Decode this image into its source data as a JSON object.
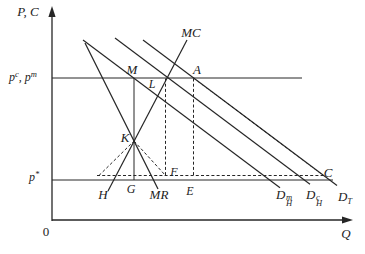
{
  "figure": {
    "width": 365,
    "height": 254,
    "background_color": "#ffffff",
    "line_color": "#262626",
    "axes": {
      "y_axis": {
        "x": 52,
        "y_top": 14,
        "y_bottom": 221,
        "label": "P, C"
      },
      "x_axis": {
        "y": 220,
        "x_left": 52,
        "x_right": 347,
        "label": "Q"
      },
      "origin_label": "0"
    },
    "price_lines": [
      {
        "id": "cartel-monopoly-price",
        "label": "p^c, p^m",
        "y": 78
      },
      {
        "id": "world-price",
        "label": "p*",
        "y": 180
      }
    ],
    "curve_labels": [
      "MC",
      "MR",
      "D_H^m",
      "D_H^c",
      "D_T"
    ],
    "point_labels": [
      "M",
      "A",
      "L",
      "K",
      "F",
      "G",
      "H",
      "E",
      "C"
    ],
    "lines": [
      {
        "name": "pc-pm-price-line",
        "x1": 52,
        "y1": 78,
        "x2": 302,
        "y2": 78,
        "dashed": false,
        "w": 1.0
      },
      {
        "name": "p-star-price-line",
        "x1": 52,
        "y1": 180,
        "x2": 333,
        "y2": 180,
        "dashed": false,
        "w": 1.0
      },
      {
        "name": "mr-curve",
        "x1": 85,
        "y1": 43,
        "x2": 158,
        "y2": 189,
        "dashed": false,
        "w": 1.2
      },
      {
        "name": "mc-curve",
        "x1": 108,
        "y1": 191,
        "x2": 187,
        "y2": 40,
        "dashed": false,
        "w": 1.2
      },
      {
        "name": "dhm-demand-curve",
        "x1": 83,
        "y1": 40,
        "x2": 280,
        "y2": 187.7,
        "dashed": false,
        "w": 1.2
      },
      {
        "name": "dhc-demand-curve",
        "x1": 115,
        "y1": 38,
        "x2": 310,
        "y2": 184.3,
        "dashed": false,
        "w": 1.2
      },
      {
        "name": "dt-demand-curve",
        "x1": 143,
        "y1": 40,
        "x2": 337,
        "y2": 185.6,
        "dashed": false,
        "w": 1.2
      },
      {
        "name": "monopoly-quantity-vertical-MG",
        "x1": 134,
        "y1": 78,
        "x2": 134,
        "y2": 180,
        "dashed": false,
        "w": 1.0
      },
      {
        "name": "dashed-horizontal-above-p-star",
        "x1": 97,
        "y1": 175.5,
        "x2": 323.5,
        "y2": 175.5,
        "dashed": true,
        "w": 1.0
      },
      {
        "name": "dashed-vertical-LF",
        "x1": 165.5,
        "y1": 78.5,
        "x2": 165.5,
        "y2": 175.5,
        "dashed": true,
        "w": 1.0
      },
      {
        "name": "dashed-vertical-AE",
        "x1": 193.5,
        "y1": 78.5,
        "x2": 193.5,
        "y2": 175.5,
        "dashed": true,
        "w": 1.0
      },
      {
        "name": "dashed-diagonal-AC",
        "x1": 193.5,
        "y1": 78,
        "x2": 323.5,
        "y2": 175.5,
        "dashed": true,
        "w": 1.0
      },
      {
        "name": "dashed-segment-HK",
        "x1": 99,
        "y1": 175.5,
        "x2": 134,
        "y2": 141,
        "dashed": true,
        "w": 1.0
      },
      {
        "name": "dashed-segment-KF",
        "x1": 134,
        "y1": 141,
        "x2": 165.5,
        "y2": 175.5,
        "dashed": true,
        "w": 1.0
      }
    ],
    "arrows": [
      {
        "name": "y-axis-arrow",
        "points": "52,6 48.4,17 55.6,17"
      },
      {
        "name": "x-axis-arrow",
        "points": "353,220 342,216.4 342,223.6"
      }
    ],
    "axis_segments": [
      {
        "name": "y-axis-line",
        "x1": 52,
        "y1": 221,
        "x2": 52,
        "y2": 14,
        "dashed": false,
        "w": 1.3
      },
      {
        "name": "x-axis-line",
        "x1": 52,
        "y1": 220,
        "x2": 347,
        "y2": 220,
        "dashed": false,
        "w": 1.3
      }
    ],
    "labels": [
      {
        "name": "label-y-axis",
        "x": 28,
        "y": 11,
        "parts": [
          {
            "t": "P, C"
          }
        ]
      },
      {
        "name": "label-pc-pm",
        "x": 23,
        "y": 77,
        "parts": [
          {
            "t": "p"
          },
          {
            "sup": "c"
          },
          {
            "t": ", "
          },
          {
            "t": "p"
          },
          {
            "sup": "m"
          }
        ],
        "size": 12
      },
      {
        "name": "label-p-star",
        "x": 34,
        "y": 177,
        "parts": [
          {
            "t": "p"
          },
          {
            "sup": "*"
          }
        ],
        "size": 12
      },
      {
        "name": "label-origin",
        "x": 46,
        "y": 231,
        "parts": [
          {
            "t": "0"
          }
        ],
        "upright": true
      },
      {
        "name": "label-x-axis",
        "x": 346,
        "y": 233,
        "parts": [
          {
            "t": "Q"
          }
        ]
      },
      {
        "name": "label-mc",
        "x": 191,
        "y": 32,
        "parts": [
          {
            "t": "MC"
          }
        ]
      },
      {
        "name": "label-mr",
        "x": 159,
        "y": 194,
        "parts": [
          {
            "t": "MR"
          }
        ]
      },
      {
        "name": "label-point-m",
        "x": 132,
        "y": 69,
        "parts": [
          {
            "t": "M"
          }
        ]
      },
      {
        "name": "label-point-a",
        "x": 197,
        "y": 69,
        "parts": [
          {
            "t": "A"
          }
        ]
      },
      {
        "name": "label-point-l",
        "x": 152,
        "y": 84,
        "parts": [
          {
            "t": "L"
          }
        ],
        "size": 12
      },
      {
        "name": "label-point-k",
        "x": 125,
        "y": 137,
        "parts": [
          {
            "t": "K"
          }
        ]
      },
      {
        "name": "label-point-f",
        "x": 174,
        "y": 172,
        "parts": [
          {
            "t": "F"
          }
        ],
        "size": 12
      },
      {
        "name": "label-point-g",
        "x": 131,
        "y": 189,
        "parts": [
          {
            "t": "G"
          }
        ],
        "size": 12
      },
      {
        "name": "label-point-h",
        "x": 103,
        "y": 194,
        "parts": [
          {
            "t": "H"
          }
        ]
      },
      {
        "name": "label-point-e",
        "x": 190,
        "y": 191,
        "parts": [
          {
            "t": "E"
          }
        ],
        "size": 12
      },
      {
        "name": "label-point-c",
        "x": 328,
        "y": 172,
        "parts": [
          {
            "t": "C"
          }
        ]
      },
      {
        "name": "label-dhm",
        "x": 284,
        "y": 196,
        "parts": [
          {
            "t": "D"
          },
          {
            "stack": {
              "sup": "m",
              "sub": "H"
            }
          }
        ]
      },
      {
        "name": "label-dhc",
        "x": 314,
        "y": 196,
        "parts": [
          {
            "t": "D"
          },
          {
            "stack": {
              "sup": "c",
              "sub": "H"
            }
          }
        ]
      },
      {
        "name": "label-dt",
        "x": 345,
        "y": 196,
        "parts": [
          {
            "t": "D"
          },
          {
            "sub": "T"
          }
        ]
      }
    ]
  }
}
